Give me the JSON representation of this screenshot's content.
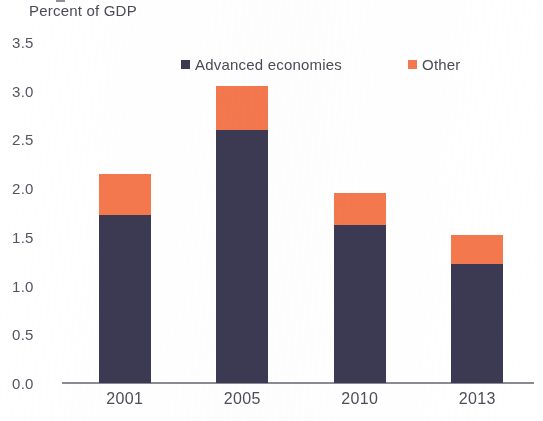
{
  "chart_data": {
    "type": "bar",
    "title": "",
    "ylabel": "Percent of GDP",
    "xlabel": "",
    "stacked": true,
    "categories": [
      "2001",
      "2005",
      "2010",
      "2013"
    ],
    "series": [
      {
        "name": "Advanced economies",
        "color": "#3b3a52",
        "values": [
          1.72,
          2.6,
          1.62,
          1.22
        ]
      },
      {
        "name": "Other",
        "color": "#f4784e",
        "values": [
          0.43,
          0.45,
          0.33,
          0.3
        ]
      }
    ],
    "totals": [
      2.15,
      3.05,
      1.95,
      1.52
    ],
    "ylim": [
      0.0,
      3.5
    ],
    "ytick_labels": [
      "3.5",
      "3.0",
      "2.5",
      "2.0",
      "1.5",
      "1.0",
      "0.5",
      "0.0"
    ],
    "ytick_values": [
      3.5,
      3.0,
      2.5,
      2.0,
      1.5,
      1.0,
      0.5,
      0.0
    ],
    "grid": false,
    "legend_position": "top-center",
    "legend": [
      {
        "label": "Advanced economies",
        "color": "#3b3a52",
        "marker": "square"
      },
      {
        "label": "Other",
        "color": "#f4784e",
        "marker": "square"
      }
    ]
  },
  "axis": {
    "y_title": "Percent of GDP"
  }
}
